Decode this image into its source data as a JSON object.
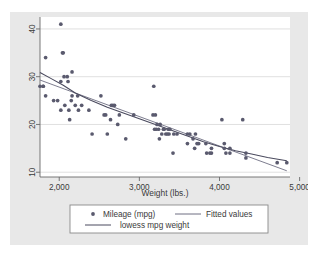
{
  "chart_data": {
    "type": "scatter",
    "title": "",
    "xlabel": "Weight (lbs.)",
    "ylabel": "",
    "xlim": [
      1760,
      4880
    ],
    "ylim": [
      9.0,
      42.5
    ],
    "xticks": [
      2000,
      3000,
      4000,
      5000
    ],
    "xtick_labels": [
      "2,000",
      "3,000",
      "4,000",
      "5,000"
    ],
    "yticks": [
      10,
      20,
      30,
      40
    ],
    "ytick_labels": [
      "10",
      "20",
      "30",
      "40"
    ],
    "grid": "horizontal",
    "legend_position": "below-plot",
    "marker_color": "#5a5a6e",
    "fitted_line_color": "#6e6e82",
    "lowess_line_color": "#4a4a5e",
    "plot_background": "#ffffff",
    "figure_background": "#e8e8e8",
    "series": [
      {
        "name": "Mileage (mpg)",
        "type": "scatter",
        "points": [
          [
            1760,
            28
          ],
          [
            1800,
            28
          ],
          [
            1800,
            28
          ],
          [
            1830,
            34
          ],
          [
            1830,
            26
          ],
          [
            1930,
            25
          ],
          [
            1980,
            25
          ],
          [
            2020,
            41
          ],
          [
            2020,
            29
          ],
          [
            2020,
            23
          ],
          [
            2040,
            35
          ],
          [
            2050,
            35
          ],
          [
            2060,
            30
          ],
          [
            2070,
            24
          ],
          [
            2100,
            30
          ],
          [
            2110,
            29
          ],
          [
            2120,
            23
          ],
          [
            2130,
            21
          ],
          [
            2150,
            25
          ],
          [
            2160,
            31
          ],
          [
            2160,
            26
          ],
          [
            2200,
            24
          ],
          [
            2230,
            26
          ],
          [
            2240,
            23
          ],
          [
            2280,
            24
          ],
          [
            2370,
            23
          ],
          [
            2410,
            18
          ],
          [
            2520,
            26
          ],
          [
            2560,
            22
          ],
          [
            2580,
            22
          ],
          [
            2600,
            18
          ],
          [
            2640,
            21
          ],
          [
            2650,
            24
          ],
          [
            2670,
            24
          ],
          [
            2690,
            24
          ],
          [
            2730,
            20
          ],
          [
            2750,
            22
          ],
          [
            2830,
            17
          ],
          [
            2930,
            22
          ],
          [
            3170,
            22
          ],
          [
            3180,
            28
          ],
          [
            3190,
            19
          ],
          [
            3200,
            22
          ],
          [
            3210,
            19
          ],
          [
            3220,
            20
          ],
          [
            3240,
            19
          ],
          [
            3250,
            17
          ],
          [
            3260,
            20
          ],
          [
            3280,
            18
          ],
          [
            3300,
            19
          ],
          [
            3310,
            19
          ],
          [
            3330,
            18
          ],
          [
            3350,
            18
          ],
          [
            3360,
            19
          ],
          [
            3370,
            18
          ],
          [
            3380,
            19
          ],
          [
            3420,
            14
          ],
          [
            3430,
            18
          ],
          [
            3470,
            18
          ],
          [
            3600,
            16
          ],
          [
            3600,
            18
          ],
          [
            3630,
            18
          ],
          [
            3670,
            17
          ],
          [
            3690,
            15
          ],
          [
            3700,
            18
          ],
          [
            3720,
            16
          ],
          [
            3740,
            16
          ],
          [
            3830,
            16
          ],
          [
            3840,
            14
          ],
          [
            3880,
            14
          ],
          [
            3900,
            15
          ],
          [
            3900,
            14
          ],
          [
            4030,
            21
          ],
          [
            4060,
            15
          ],
          [
            4060,
            16
          ],
          [
            4080,
            14
          ],
          [
            4130,
            14
          ],
          [
            4130,
            15
          ],
          [
            4290,
            21
          ],
          [
            4330,
            14
          ],
          [
            4330,
            13
          ],
          [
            4720,
            12
          ],
          [
            4840,
            12
          ]
        ]
      },
      {
        "name": "Fitted values",
        "type": "line",
        "points": [
          [
            1760,
            29.3
          ],
          [
            4840,
            10.3
          ]
        ]
      },
      {
        "name": "lowess mpg  weight",
        "type": "line",
        "points": [
          [
            1760,
            30.9
          ],
          [
            1900,
            29.6
          ],
          [
            2050,
            28.2
          ],
          [
            2200,
            26.6
          ],
          [
            2400,
            25.0
          ],
          [
            2600,
            23.6
          ],
          [
            2800,
            22.4
          ],
          [
            3000,
            21.2
          ],
          [
            3200,
            20.0
          ],
          [
            3400,
            18.8
          ],
          [
            3600,
            17.6
          ],
          [
            3800,
            16.4
          ],
          [
            4000,
            15.4
          ],
          [
            4200,
            14.5
          ],
          [
            4400,
            13.8
          ],
          [
            4600,
            13.1
          ],
          [
            4840,
            12.4
          ]
        ]
      }
    ]
  },
  "legend": {
    "entries": [
      {
        "label": "Mileage (mpg)",
        "glyph": "marker"
      },
      {
        "label": "Fitted values",
        "glyph": "line"
      },
      {
        "label": "lowess mpg  weight",
        "glyph": "line"
      }
    ]
  }
}
